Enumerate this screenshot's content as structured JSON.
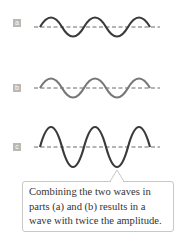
{
  "panels": [
    {
      "label": "a",
      "wave_color": "#3a3a3a",
      "amplitude": "single"
    },
    {
      "label": "b",
      "wave_color": "#777777",
      "amplitude": "single"
    },
    {
      "label": "c",
      "wave_color": "#3a3a3a",
      "amplitude": "double"
    }
  ],
  "callout": {
    "line1": "Combining the two waves in",
    "line2": "parts (a) and (b) results in a",
    "line3": "wave with twice the amplitude."
  }
}
